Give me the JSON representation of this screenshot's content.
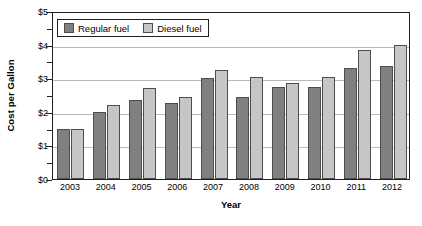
{
  "chart_data": {
    "type": "bar",
    "title": "",
    "xlabel": "Year",
    "ylabel": "Cost per Gallon",
    "categories": [
      "2003",
      "2004",
      "2005",
      "2006",
      "2007",
      "2008",
      "2009",
      "2010",
      "2011",
      "2012"
    ],
    "series": [
      {
        "name": "Regular fuel",
        "color": "#808080",
        "values": [
          1.5,
          2.0,
          2.35,
          2.25,
          3.0,
          2.45,
          2.75,
          2.75,
          3.3,
          3.35
        ]
      },
      {
        "name": "Diesel fuel",
        "color": "#c6c6c6",
        "values": [
          1.5,
          2.2,
          2.7,
          2.45,
          3.25,
          3.05,
          2.85,
          3.05,
          3.85,
          4.0
        ]
      }
    ],
    "ylim": [
      0,
      5
    ],
    "ytick_labels": [
      "$0",
      "$1",
      "$2",
      "$3",
      "$4",
      "$5"
    ],
    "ytick_values": [
      0,
      1,
      2,
      3,
      4,
      5
    ],
    "yminor_values": [
      0.5,
      1.5,
      2.5,
      3.5,
      4.5
    ],
    "grid": true,
    "legend_position": "top-left"
  },
  "legend": {
    "items": [
      {
        "label": "Regular fuel"
      },
      {
        "label": "Diesel fuel"
      }
    ]
  },
  "axes": {
    "y_title": "Cost per Gallon",
    "x_title": "Year"
  }
}
